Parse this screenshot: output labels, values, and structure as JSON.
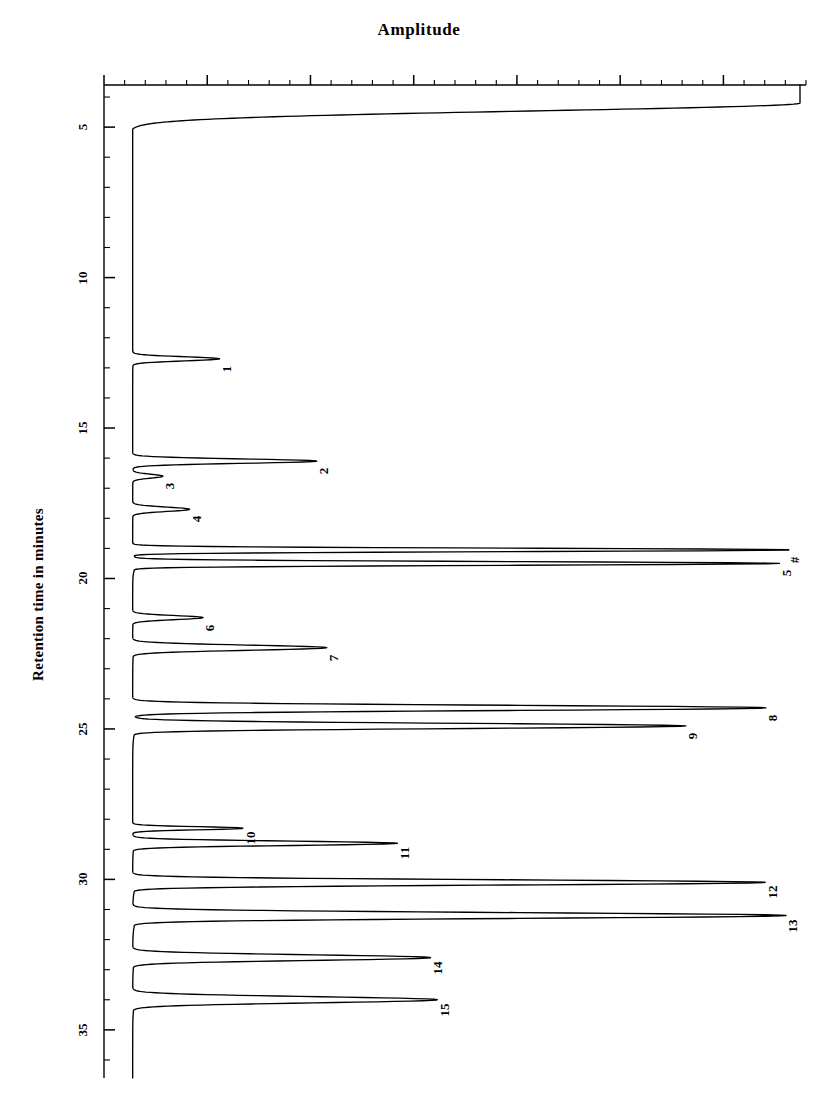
{
  "chart_data": {
    "type": "line",
    "title": "Amplitude",
    "xlabel": "Amplitude",
    "ylabel": "Retention time in minutes",
    "orientation": "rotated-90",
    "axis": {
      "name": "Retention time in minutes",
      "unit": "minutes",
      "range": [
        3.6,
        36.6
      ],
      "major_ticks": [
        5,
        10,
        15,
        20,
        25,
        30,
        35
      ],
      "major_tick_labels": [
        "5",
        "10",
        "15",
        "20",
        "25",
        "30",
        "35"
      ],
      "minor_tick_interval": 1,
      "grid": "off",
      "legend": "none"
    },
    "amplitude_axis": {
      "baseline_position_px": 130,
      "max_position_px": 800,
      "labels_shown": false
    },
    "peaks": [
      {
        "label": "1",
        "retention_time": 12.7,
        "height": 0.13,
        "width": 0.16
      },
      {
        "label": "2",
        "retention_time": 16.1,
        "height": 0.275,
        "width": 0.17
      },
      {
        "label": "3",
        "retention_time": 16.6,
        "height": 0.045,
        "width": 0.15
      },
      {
        "label": "4",
        "retention_time": 17.7,
        "height": 0.085,
        "width": 0.17
      },
      {
        "label": "#",
        "retention_time": 19.05,
        "height": 0.985,
        "width": 0.13
      },
      {
        "label": "5",
        "retention_time": 19.5,
        "height": 0.965,
        "width": 0.14
      },
      {
        "label": "6",
        "retention_time": 21.3,
        "height": 0.105,
        "width": 0.16
      },
      {
        "label": "7",
        "retention_time": 22.3,
        "height": 0.29,
        "width": 0.2
      },
      {
        "label": "8",
        "retention_time": 24.3,
        "height": 0.945,
        "width": 0.2
      },
      {
        "label": "9",
        "retention_time": 24.9,
        "height": 0.825,
        "width": 0.2
      },
      {
        "label": "10",
        "retention_time": 28.3,
        "height": 0.165,
        "width": 0.12
      },
      {
        "label": "11",
        "retention_time": 28.8,
        "height": 0.395,
        "width": 0.17
      },
      {
        "label": "12",
        "retention_time": 30.1,
        "height": 0.945,
        "width": 0.2
      },
      {
        "label": "13",
        "retention_time": 31.2,
        "height": 0.975,
        "width": 0.22
      },
      {
        "label": "14",
        "retention_time": 32.6,
        "height": 0.445,
        "width": 0.22
      },
      {
        "label": "15",
        "retention_time": 34.0,
        "height": 0.455,
        "width": 0.24
      }
    ],
    "solvent_front": {
      "retention_time": 4.2,
      "height": 1.0,
      "note": "off-scale solvent front at start of run"
    },
    "series_name": "detector response"
  },
  "title": {
    "text": "Amplitude"
  },
  "axis_caption": {
    "text": "Retention time in minutes"
  },
  "tick_labels": [
    "5",
    "10",
    "15",
    "20",
    "25",
    "30",
    "35"
  ],
  "peak_labels": [
    "1",
    "2",
    "3",
    "4",
    "#",
    "5",
    "6",
    "7",
    "8",
    "9",
    "10",
    "11",
    "12",
    "13",
    "14",
    "15"
  ],
  "colors": {
    "trace": "#000000",
    "axis": "#000000",
    "background": "#ffffff"
  }
}
